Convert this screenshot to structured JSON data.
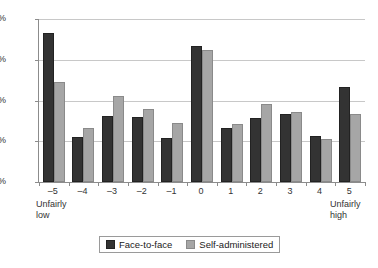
{
  "chart_data": {
    "type": "bar",
    "title": "",
    "subtitle": "",
    "xlabel": "",
    "ylabel": "",
    "categories": [
      "-5",
      "-4",
      "-3",
      "-2",
      "-1",
      "0",
      "1",
      "2",
      "3",
      "4",
      "5"
    ],
    "category_anchors": {
      "low": "Unfairly\nlow",
      "low_line1": "Unfairly",
      "low_line2": "low",
      "high_line1": "Unfairly",
      "high_line2": "high"
    },
    "series": [
      {
        "name": "Face-to-face",
        "color": "#333333",
        "values": [
          18.3,
          5.5,
          8.1,
          8.0,
          5.4,
          16.7,
          6.6,
          7.9,
          8.4,
          5.7,
          11.6
        ]
      },
      {
        "name": "Self-administered",
        "color": "#a6a6a6",
        "values": [
          12.3,
          6.6,
          10.5,
          8.9,
          7.3,
          16.2,
          7.1,
          9.6,
          8.6,
          5.3,
          8.3
        ]
      }
    ],
    "ylim": [
      0,
      20
    ],
    "ytick_values": [
      0,
      5,
      10,
      15,
      20
    ],
    "ytick_labels": [
      "0%",
      "5%",
      "10%",
      "15%",
      "20%"
    ],
    "grid": true,
    "grid_axis": "y",
    "legend_position": "bottom"
  }
}
